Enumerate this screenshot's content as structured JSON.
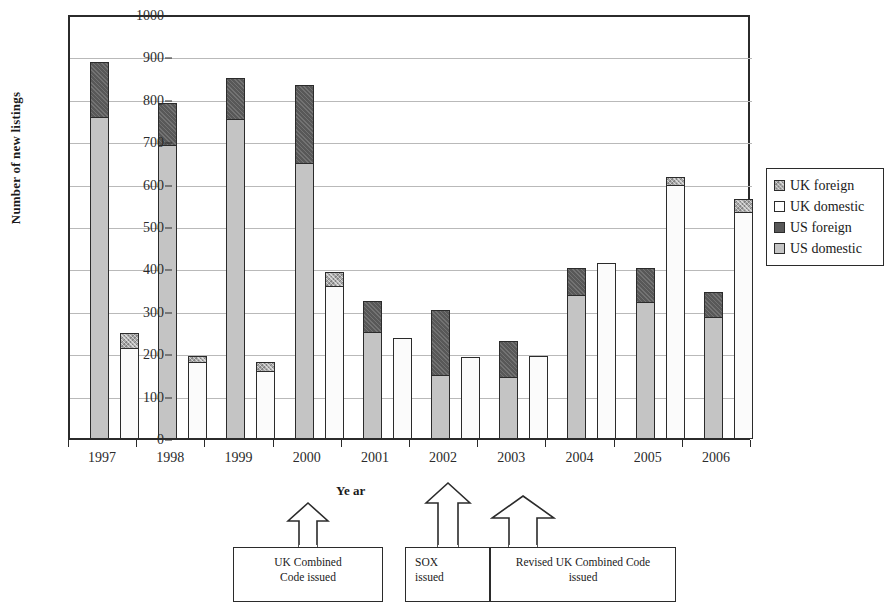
{
  "chart_data": {
    "type": "bar",
    "subtype": "stacked-grouped",
    "title": "",
    "xlabel": "Ye ar",
    "ylabel": "Number of new listings",
    "ylim": [
      0,
      1000
    ],
    "ytick_step": 100,
    "yticks": [
      "1000",
      "900",
      "800",
      "700",
      "600",
      "500",
      "400",
      "300",
      "200",
      "100",
      "0"
    ],
    "grid": true,
    "legend_position": "right",
    "categories": [
      "1997",
      "1998",
      "1999",
      "2000",
      "2001",
      "2002",
      "2003",
      "2004",
      "2005",
      "2006"
    ],
    "legend": [
      "UK foreign",
      "UK domestic",
      "US foreign",
      "US domestic"
    ],
    "series": [
      {
        "name": "US domestic",
        "group": "US",
        "values": [
          760,
          694,
          756,
          651,
          253,
          151,
          146,
          340,
          325,
          288
        ]
      },
      {
        "name": "US foreign",
        "group": "US",
        "values": [
          133,
          103,
          99,
          187,
          77,
          158,
          88,
          68,
          83,
          62
        ]
      },
      {
        "name": "UK domestic",
        "group": "UK",
        "values": [
          215,
          183,
          161,
          361,
          240,
          193,
          196,
          415,
          600,
          536
        ]
      },
      {
        "name": "UK foreign",
        "group": "UK",
        "values": [
          38,
          17,
          24,
          36,
          0,
          0,
          0,
          0,
          22,
          33
        ]
      }
    ],
    "stack_totals": {
      "US": [
        893,
        797,
        855,
        838,
        330,
        309,
        234,
        408,
        408,
        350
      ],
      "UK": [
        253,
        200,
        185,
        397,
        240,
        193,
        196,
        415,
        622,
        569
      ]
    },
    "annotations": [
      {
        "id": "uk-combined-code",
        "text_lines": [
          "UK Combined",
          "Code issued"
        ],
        "points_to": "2000"
      },
      {
        "id": "sox",
        "text_lines": [
          "SOX",
          "issued"
        ],
        "points_to": "2002"
      },
      {
        "id": "revised-uk-combined-code",
        "text_lines": [
          "Revised UK Combined Code",
          "issued"
        ],
        "points_to": "2003"
      }
    ],
    "colors": {
      "us_domestic": "#c4c4c4",
      "us_foreign": "#585858",
      "uk_domestic": "#fbfbfb",
      "uk_foreign": "#a8a8a8",
      "axis": "#2b2b2b",
      "grid": "#b9b9b9",
      "background": "#ffffff"
    }
  }
}
